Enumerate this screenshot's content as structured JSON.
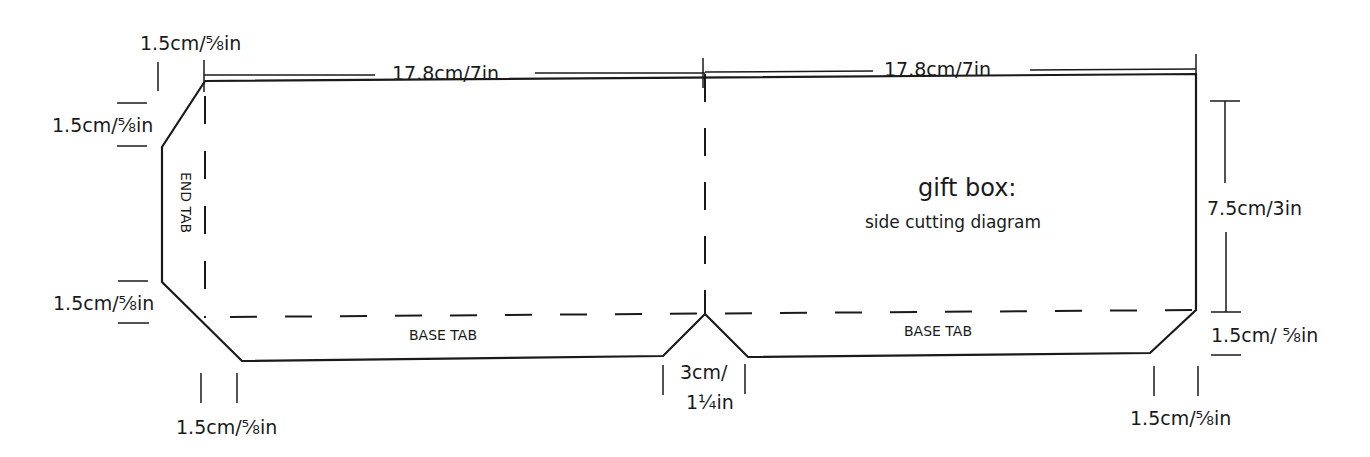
{
  "diagram": {
    "title": "gift box:",
    "subtitle": "side cutting diagram",
    "colors": {
      "line": "#1a1a1a",
      "background": "#ffffff"
    },
    "labels": {
      "top_left_chamfer_width": "1.5cm/⅝in",
      "top_span_left": "17.8cm/7in",
      "top_span_right": "17.8cm/7in",
      "left_upper_chamfer_height": "1.5cm/⅝in",
      "left_lower_chamfer_height": "1.5cm/⅝in",
      "end_tab": "END TAB",
      "base_tab_left": "BASE TAB",
      "base_tab_right": "BASE TAB",
      "side_height": "7.5cm/3in",
      "right_base_tab_height": "1.5cm/ ⅝in",
      "bottom_left_chamfer_width": "1.5cm/⅝in",
      "notch_width_line1": "3cm/",
      "notch_width_line2": "1¼in",
      "bottom_right_chamfer_width": "1.5cm/⅝in"
    }
  }
}
